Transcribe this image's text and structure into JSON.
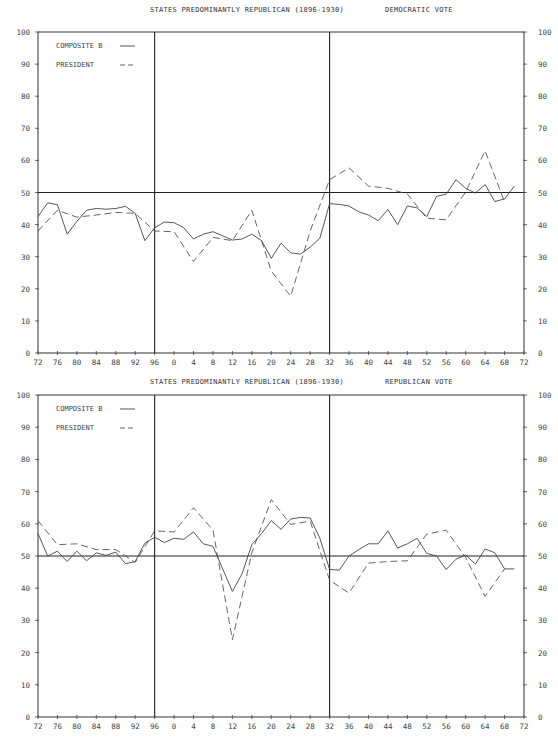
{
  "chart_data": [
    {
      "type": "line",
      "title": "STATES PREDOMINANTLY REPUBLICAN (1896-1930)",
      "subtitle": "DEMOCRATIC VOTE",
      "xlabel": "",
      "ylabel": "",
      "ylim": [
        0,
        100
      ],
      "xlim": [
        1872,
        1972
      ],
      "x_tick_labels": [
        "72",
        "76",
        "80",
        "84",
        "88",
        "92",
        "96",
        "0",
        "4",
        "8",
        "12",
        "16",
        "20",
        "24",
        "28",
        "32",
        "36",
        "40",
        "44",
        "48",
        "52",
        "56",
        "60",
        "64",
        "68",
        "72"
      ],
      "y_tick_labels": [
        "0",
        "10",
        "20",
        "30",
        "40",
        "50",
        "60",
        "70",
        "80",
        "90",
        "100"
      ],
      "reference_lines": {
        "horizontal": 50,
        "vertical": [
          1896,
          1932
        ]
      },
      "grid": false,
      "legend": [
        {
          "name": "COMPOSITE B",
          "style": "solid"
        },
        {
          "name": "PRESIDENT",
          "style": "dashed"
        }
      ],
      "legend_position": "upper-left",
      "series": [
        {
          "name": "COMPOSITE B",
          "style": "solid",
          "x": [
            1872,
            1874,
            1876,
            1878,
            1880,
            1882,
            1884,
            1886,
            1888,
            1890,
            1892,
            1894,
            1896,
            1898,
            1900,
            1902,
            1904,
            1906,
            1908,
            1910,
            1912,
            1914,
            1916,
            1918,
            1920,
            1922,
            1924,
            1926,
            1928,
            1930,
            1932,
            1934,
            1936,
            1938,
            1940,
            1942,
            1944,
            1946,
            1948,
            1950,
            1952,
            1954,
            1956,
            1958,
            1960,
            1962,
            1964,
            1966,
            1968,
            1970
          ],
          "values": [
            42.5,
            46.8,
            46.2,
            37.0,
            41.0,
            44.5,
            45.0,
            44.8,
            45.0,
            45.7,
            43.5,
            35.0,
            39.0,
            40.8,
            40.6,
            39.0,
            35.5,
            37.0,
            37.8,
            36.5,
            35.2,
            35.5,
            37.0,
            35.0,
            29.5,
            34.2,
            31.2,
            30.8,
            33.0,
            35.8,
            46.5,
            46.3,
            45.8,
            44.0,
            43.0,
            41.2,
            44.7,
            40.0,
            45.8,
            45.2,
            42.5,
            48.8,
            49.5,
            54.0,
            51.3,
            49.8,
            52.5,
            47.2,
            48.0,
            52.0
          ]
        },
        {
          "name": "PRESIDENT",
          "style": "dashed",
          "x": [
            1872,
            1876,
            1880,
            1884,
            1888,
            1892,
            1896,
            1900,
            1904,
            1908,
            1912,
            1916,
            1920,
            1924,
            1928,
            1932,
            1936,
            1940,
            1944,
            1948,
            1952,
            1956,
            1960,
            1964,
            1968
          ],
          "values": [
            38.0,
            44.5,
            42.3,
            43.0,
            43.8,
            43.5,
            38.0,
            37.8,
            28.5,
            36.0,
            35.0,
            44.5,
            25.5,
            17.7,
            38.0,
            54.0,
            57.7,
            52.0,
            51.3,
            49.5,
            42.0,
            41.5,
            50.2,
            63.0,
            47.0
          ]
        }
      ]
    },
    {
      "type": "line",
      "title": "STATES PREDOMINANTLY REPUBLICAN (1896-1930)",
      "subtitle": "REPUBLICAN VOTE",
      "xlabel": "",
      "ylabel": "",
      "ylim": [
        0,
        100
      ],
      "xlim": [
        1872,
        1972
      ],
      "x_tick_labels": [
        "72",
        "76",
        "80",
        "84",
        "88",
        "92",
        "96",
        "0",
        "4",
        "8",
        "12",
        "16",
        "20",
        "24",
        "28",
        "32",
        "36",
        "40",
        "44",
        "48",
        "52",
        "56",
        "60",
        "64",
        "68",
        "72"
      ],
      "y_tick_labels": [
        "0",
        "10",
        "20",
        "30",
        "40",
        "50",
        "60",
        "70",
        "80",
        "90",
        "100"
      ],
      "reference_lines": {
        "horizontal": 50,
        "vertical": [
          1896,
          1932
        ]
      },
      "grid": false,
      "legend": [
        {
          "name": "COMPOSITE B",
          "style": "solid"
        },
        {
          "name": "PRESIDENT",
          "style": "dashed"
        }
      ],
      "legend_position": "upper-left",
      "series": [
        {
          "name": "COMPOSITE B",
          "style": "solid",
          "x": [
            1872,
            1874,
            1876,
            1878,
            1880,
            1882,
            1884,
            1886,
            1888,
            1890,
            1892,
            1894,
            1896,
            1898,
            1900,
            1902,
            1904,
            1906,
            1908,
            1910,
            1912,
            1914,
            1916,
            1918,
            1920,
            1922,
            1924,
            1926,
            1928,
            1930,
            1932,
            1934,
            1936,
            1938,
            1940,
            1942,
            1944,
            1946,
            1948,
            1950,
            1952,
            1954,
            1956,
            1958,
            1960,
            1962,
            1964,
            1966,
            1968,
            1970
          ],
          "values": [
            57.0,
            50.0,
            51.5,
            48.3,
            51.5,
            48.5,
            51.0,
            50.2,
            51.2,
            47.6,
            48.3,
            54.0,
            55.8,
            54.2,
            55.5,
            55.2,
            57.5,
            53.8,
            53.0,
            46.0,
            39.0,
            44.5,
            53.5,
            57.0,
            61.0,
            58.3,
            61.5,
            62.0,
            61.8,
            55.5,
            45.8,
            45.6,
            50.0,
            52.0,
            53.8,
            53.8,
            57.8,
            52.5,
            53.8,
            55.5,
            50.8,
            50.0,
            45.8,
            49.0,
            50.3,
            47.5,
            52.2,
            51.0,
            46.0,
            46.0
          ]
        },
        {
          "name": "PRESIDENT",
          "style": "dashed",
          "x": [
            1872,
            1876,
            1880,
            1884,
            1888,
            1892,
            1896,
            1900,
            1904,
            1908,
            1912,
            1916,
            1920,
            1924,
            1928,
            1932,
            1936,
            1940,
            1944,
            1948,
            1952,
            1956,
            1960,
            1964,
            1968
          ],
          "values": [
            61.0,
            53.5,
            53.8,
            52.0,
            52.0,
            48.0,
            57.8,
            57.5,
            65.0,
            58.0,
            24.0,
            51.0,
            67.5,
            59.8,
            60.8,
            42.5,
            38.5,
            47.8,
            48.3,
            48.5,
            56.8,
            58.0,
            49.5,
            37.5,
            46.0
          ]
        }
      ]
    }
  ],
  "panels": [
    {
      "title": "STATES PREDOMINANTLY REPUBLICAN (1896-1930)",
      "subtitle": "DEMOCRATIC VOTE",
      "legend_composite": "COMPOSITE B",
      "legend_president": "PRESIDENT"
    },
    {
      "title": "STATES PREDOMINANTLY REPUBLICAN (1896-1930)",
      "subtitle": "REPUBLICAN VOTE",
      "legend_composite": "COMPOSITE B",
      "legend_president": "PRESIDENT"
    }
  ]
}
